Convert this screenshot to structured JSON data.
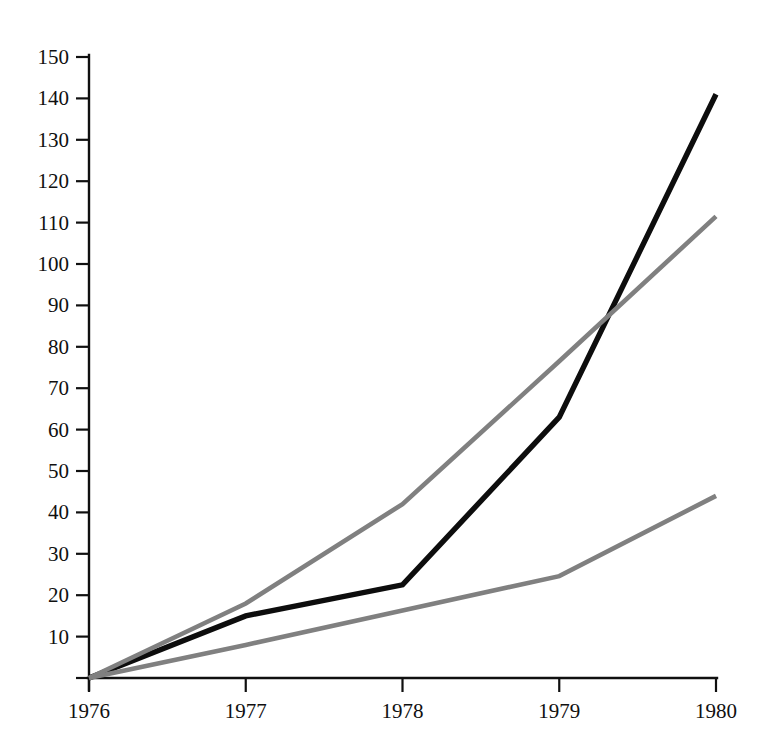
{
  "chart_data": {
    "type": "line",
    "title": "",
    "subtitle": "",
    "xlabel": "",
    "ylabel": "",
    "x": [
      1976,
      1977,
      1978,
      1979,
      1980
    ],
    "categories": [
      "1976",
      "1977",
      "1978",
      "1979",
      "1980"
    ],
    "xlim": [
      1976,
      1980
    ],
    "ylim": [
      0,
      150
    ],
    "grid": false,
    "legend": "none",
    "y_ticks": [
      0,
      10,
      20,
      30,
      40,
      50,
      60,
      70,
      80,
      90,
      100,
      110,
      120,
      130,
      140,
      150
    ],
    "y_tick_labels": [
      "",
      "10",
      "20",
      "30",
      "40",
      "50",
      "60",
      "70",
      "80",
      "90",
      "100",
      "110",
      "120",
      "130",
      "140",
      "150"
    ],
    "x_ticks": [
      1976,
      1977,
      1978,
      1979,
      1980
    ],
    "x_tick_labels": [
      "1976",
      "1977",
      "1978",
      "1979",
      "1980"
    ],
    "series": [
      {
        "name": "series-black",
        "color": "#0d0d0d",
        "width": 5.4,
        "values": [
          0,
          15,
          22.5,
          63,
          141
        ]
      },
      {
        "name": "series-gray-upper",
        "color": "#808080",
        "width": 4.6,
        "values": [
          0,
          18,
          42,
          76.5,
          111.5
        ]
      },
      {
        "name": "series-gray-lower",
        "color": "#808080",
        "width": 4.6,
        "values": [
          0,
          8,
          16.3,
          24.6,
          44
        ]
      }
    ]
  },
  "axes": {
    "axis_color": "#101010",
    "background": "#ffffff"
  }
}
